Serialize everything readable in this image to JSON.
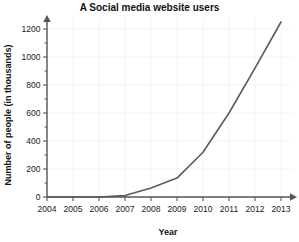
{
  "chart_data": {
    "type": "line",
    "title": "A  Social media website users",
    "xlabel": "Year",
    "ylabel": "Number of people (in thousands)",
    "categories": [
      "2004",
      "2005",
      "2006",
      "2007",
      "2008",
      "2009",
      "2010",
      "2011",
      "2012",
      "2013"
    ],
    "x": [
      2004,
      2005,
      2006,
      2007,
      2008,
      2009,
      2010,
      2011,
      2012,
      2013
    ],
    "values": [
      0,
      0,
      0,
      10,
      65,
      135,
      320,
      600,
      920,
      1250
    ],
    "series": [
      {
        "name": "Social media website users",
        "values": [
          0,
          0,
          0,
          10,
          65,
          135,
          320,
          600,
          920,
          1250
        ]
      }
    ],
    "xlim": [
      2004,
      2013
    ],
    "ylim": [
      0,
      1300
    ],
    "ytick_labels": [
      "0",
      "200",
      "400",
      "600",
      "800",
      "1000",
      "1200"
    ],
    "ytick_values": [
      0,
      200,
      400,
      600,
      800,
      1000,
      1200
    ],
    "yminor_tick_values": [
      100,
      300,
      500,
      700,
      900,
      1100,
      1300
    ],
    "grid": true,
    "legend": "none",
    "line_color": "#5a5a5a",
    "grid_color": "#f4f4f6",
    "axis_color": "#555555",
    "background_color": "#ffffff"
  }
}
